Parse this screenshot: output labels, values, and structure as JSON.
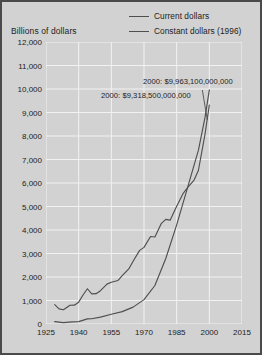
{
  "chart_data": {
    "type": "line",
    "title": "",
    "subtitle": "",
    "xlabel": "",
    "ylabel": "Billions of dollars",
    "xlim": [
      1925,
      2015
    ],
    "ylim": [
      0,
      12000
    ],
    "grid": true,
    "legend_position": "top-right",
    "x_ticks": [
      "1925",
      "1940",
      "1955",
      "1970",
      "1985",
      "2000",
      "2015"
    ],
    "y_ticks": [
      "0",
      "1,000",
      "2,000",
      "3,000",
      "4,000",
      "5,000",
      "6,000",
      "7,000",
      "8,000",
      "9,000",
      "10,000",
      "11,000",
      "12,000"
    ],
    "annotations": [
      {
        "id": "current",
        "text": "2000: $9,963,100,000,000"
      },
      {
        "id": "constant",
        "text": "2000: $9,318,500,000,000"
      }
    ],
    "series": [
      {
        "name": "Current dollars",
        "color": "#4f4f4f",
        "x": [
          1929,
          1933,
          1937,
          1940,
          1944,
          1946,
          1950,
          1955,
          1960,
          1965,
          1970,
          1975,
          1980,
          1985,
          1990,
          1995,
          1998,
          2000
        ],
        "values": [
          103,
          57,
          92,
          101,
          219,
          222,
          294,
          415,
          526,
          719,
          1038,
          1638,
          2789,
          4220,
          5803,
          7397,
          8781,
          9963
        ]
      },
      {
        "name": "Constant dollars (1996)",
        "color": "#4f4f4f",
        "x": [
          1929,
          1931,
          1933,
          1936,
          1938,
          1940,
          1942,
          1944,
          1946,
          1948,
          1950,
          1953,
          1955,
          1958,
          1960,
          1963,
          1965,
          1968,
          1970,
          1973,
          1975,
          1978,
          1980,
          1982,
          1985,
          1988,
          1990,
          1993,
          1995,
          1998,
          2000
        ],
        "values": [
          823,
          643,
          604,
          799,
          801,
          929,
          1235,
          1500,
          1280,
          1290,
          1418,
          1697,
          1779,
          1850,
          2057,
          2343,
          2673,
          3132,
          3260,
          3722,
          3702,
          4284,
          4453,
          4418,
          5009,
          5560,
          5803,
          6124,
          6542,
          8073,
          9318
        ]
      }
    ]
  },
  "axis_title": "Billions of dollars",
  "legend": {
    "items": [
      {
        "label": "Current dollars"
      },
      {
        "label": "Constant dollars (1996)"
      }
    ]
  }
}
